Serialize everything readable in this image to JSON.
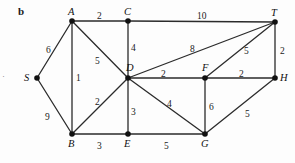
{
  "figure": {
    "panel_label": "b",
    "width": 295,
    "height": 163,
    "background_color": "#fdfdfd",
    "edge_color": "#2b2b2b",
    "node_color": "#111111",
    "left_margin_tick": "·"
  },
  "chart_data": {
    "type": "diagram",
    "title": "b",
    "nodes": [
      {
        "id": "A",
        "label": "A",
        "x": 72,
        "y": 21,
        "label_dx": -4,
        "label_dy": -14
      },
      {
        "id": "C",
        "label": "C",
        "x": 128,
        "y": 21,
        "label_dx": -4,
        "label_dy": -14
      },
      {
        "id": "T",
        "label": "T",
        "x": 275,
        "y": 22,
        "label_dx": -4,
        "label_dy": -14
      },
      {
        "id": "S",
        "label": "S",
        "x": 37,
        "y": 78,
        "label_dx": -13,
        "label_dy": -5
      },
      {
        "id": "D",
        "label": "D",
        "x": 128,
        "y": 78,
        "label_dx": -2,
        "label_dy": -15
      },
      {
        "id": "F",
        "label": "F",
        "x": 205,
        "y": 78,
        "label_dx": -3,
        "label_dy": -15
      },
      {
        "id": "H",
        "label": "H",
        "x": 275,
        "y": 78,
        "label_dx": 5,
        "label_dy": -5
      },
      {
        "id": "B",
        "label": "B",
        "x": 72,
        "y": 134,
        "label_dx": -4,
        "label_dy": 5
      },
      {
        "id": "E",
        "label": "E",
        "x": 128,
        "y": 134,
        "label_dx": -4,
        "label_dy": 5
      },
      {
        "id": "G",
        "label": "G",
        "x": 205,
        "y": 134,
        "label_dx": -4,
        "label_dy": 5
      }
    ],
    "edges": [
      {
        "from": "S",
        "to": "A",
        "weight": 6,
        "label_x": 46,
        "label_y": 46
      },
      {
        "from": "S",
        "to": "B",
        "weight": 9,
        "label_x": 45,
        "label_y": 113
      },
      {
        "from": "A",
        "to": "C",
        "weight": 2,
        "label_x": 97,
        "label_y": 12
      },
      {
        "from": "A",
        "to": "B",
        "weight": 1,
        "label_x": 76,
        "label_y": 74
      },
      {
        "from": "A",
        "to": "D",
        "weight": 5,
        "label_x": 95,
        "label_y": 57
      },
      {
        "from": "C",
        "to": "D",
        "weight": 4,
        "label_x": 131,
        "label_y": 44
      },
      {
        "from": "C",
        "to": "T",
        "weight": 10,
        "label_x": 197,
        "label_y": 12
      },
      {
        "from": "D",
        "to": "B",
        "weight": 2,
        "label_x": 95,
        "label_y": 98
      },
      {
        "from": "D",
        "to": "E",
        "weight": 3,
        "label_x": 131,
        "label_y": 108
      },
      {
        "from": "D",
        "to": "F",
        "weight": 2,
        "label_x": 161,
        "label_y": 70
      },
      {
        "from": "D",
        "to": "G",
        "weight": 4,
        "label_x": 167,
        "label_y": 100
      },
      {
        "from": "D",
        "to": "T",
        "weight": 8,
        "label_x": 190,
        "label_y": 45
      },
      {
        "from": "F",
        "to": "T",
        "weight": 5,
        "label_x": 244,
        "label_y": 47
      },
      {
        "from": "F",
        "to": "H",
        "weight": 2,
        "label_x": 239,
        "label_y": 70
      },
      {
        "from": "F",
        "to": "G",
        "weight": 6,
        "label_x": 209,
        "label_y": 103
      },
      {
        "from": "T",
        "to": "H",
        "weight": 2,
        "label_x": 280,
        "label_y": 47
      },
      {
        "from": "G",
        "to": "H",
        "weight": 5,
        "label_x": 245,
        "label_y": 110
      },
      {
        "from": "B",
        "to": "E",
        "weight": 3,
        "label_x": 97,
        "label_y": 142
      },
      {
        "from": "E",
        "to": "G",
        "weight": 5,
        "label_x": 164,
        "label_y": 142
      }
    ]
  }
}
